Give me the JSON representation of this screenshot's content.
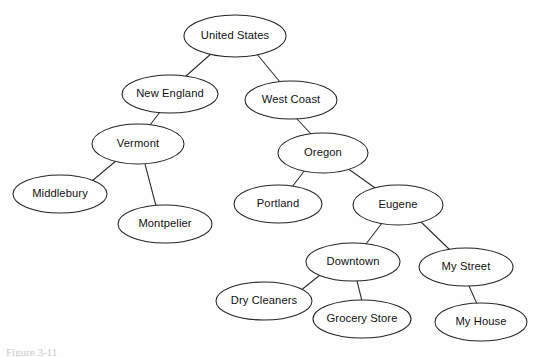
{
  "diagram": {
    "caption": "Figure 3-11",
    "stroke_color": "#232323",
    "node_fill": "#ffffff",
    "background": "#fefefe",
    "nodes": [
      {
        "id": "united-states",
        "label": "United States",
        "cx": 235,
        "cy": 36,
        "rx": 51,
        "ry": 21
      },
      {
        "id": "new-england",
        "label": "New England",
        "cx": 170,
        "cy": 94,
        "rx": 48,
        "ry": 19
      },
      {
        "id": "west-coast",
        "label": "West Coast",
        "cx": 291,
        "cy": 100,
        "rx": 46,
        "ry": 19
      },
      {
        "id": "vermont",
        "label": "Vermont",
        "cx": 138,
        "cy": 144,
        "rx": 46,
        "ry": 20
      },
      {
        "id": "oregon",
        "label": "Oregon",
        "cx": 323,
        "cy": 153,
        "rx": 45,
        "ry": 20
      },
      {
        "id": "middlebury",
        "label": "Middlebury",
        "cx": 60,
        "cy": 194,
        "rx": 47,
        "ry": 19
      },
      {
        "id": "montpelier",
        "label": "Montpelier",
        "cx": 165,
        "cy": 224,
        "rx": 47,
        "ry": 19
      },
      {
        "id": "portland",
        "label": "Portland",
        "cx": 278,
        "cy": 204,
        "rx": 44,
        "ry": 19
      },
      {
        "id": "eugene",
        "label": "Eugene",
        "cx": 398,
        "cy": 205,
        "rx": 45,
        "ry": 20
      },
      {
        "id": "downtown",
        "label": "Downtown",
        "cx": 353,
        "cy": 262,
        "rx": 47,
        "ry": 19
      },
      {
        "id": "my-street",
        "label": "My Street",
        "cx": 466,
        "cy": 267,
        "rx": 47,
        "ry": 19
      },
      {
        "id": "dry-cleaners",
        "label": "Dry Cleaners",
        "cx": 264,
        "cy": 301,
        "rx": 48,
        "ry": 19
      },
      {
        "id": "grocery-store",
        "label": "Grocery Store",
        "cx": 362,
        "cy": 319,
        "rx": 49,
        "ry": 19
      },
      {
        "id": "my-house",
        "label": "My House",
        "cx": 481,
        "cy": 322,
        "rx": 46,
        "ry": 19
      }
    ],
    "edges": [
      {
        "id": "edge-us-ne",
        "from": "united-states",
        "to": "new-england",
        "x1": 212,
        "y1": 53,
        "x2": 186,
        "y2": 76
      },
      {
        "id": "edge-us-wc",
        "from": "united-states",
        "to": "west-coast",
        "x1": 256,
        "y1": 53,
        "x2": 280,
        "y2": 82
      },
      {
        "id": "edge-ne-vt",
        "from": "new-england",
        "to": "vermont",
        "x1": 160,
        "y1": 112,
        "x2": 150,
        "y2": 125
      },
      {
        "id": "edge-wc-or",
        "from": "west-coast",
        "to": "oregon",
        "x1": 297,
        "y1": 119,
        "x2": 311,
        "y2": 134
      },
      {
        "id": "edge-vt-mid",
        "from": "vermont",
        "to": "middlebury",
        "x1": 117,
        "y1": 160,
        "x2": 92,
        "y2": 181
      },
      {
        "id": "edge-vt-mont",
        "from": "vermont",
        "to": "montpelier",
        "x1": 145,
        "y1": 164,
        "x2": 156,
        "y2": 206
      },
      {
        "id": "edge-or-port",
        "from": "oregon",
        "to": "portland",
        "x1": 305,
        "y1": 170,
        "x2": 292,
        "y2": 187
      },
      {
        "id": "edge-or-eug",
        "from": "oregon",
        "to": "eugene",
        "x1": 347,
        "y1": 168,
        "x2": 378,
        "y2": 190
      },
      {
        "id": "edge-eug-down",
        "from": "eugene",
        "to": "downtown",
        "x1": 382,
        "y1": 223,
        "x2": 366,
        "y2": 244
      },
      {
        "id": "edge-eug-street",
        "from": "eugene",
        "to": "my-street",
        "x1": 420,
        "y1": 221,
        "x2": 450,
        "y2": 250
      },
      {
        "id": "edge-down-dry",
        "from": "downtown",
        "to": "dry-cleaners",
        "x1": 320,
        "y1": 275,
        "x2": 300,
        "y2": 291
      },
      {
        "id": "edge-down-grocery",
        "from": "downtown",
        "to": "grocery-store",
        "x1": 357,
        "y1": 281,
        "x2": 362,
        "y2": 301
      },
      {
        "id": "edge-street-house",
        "from": "my-street",
        "to": "my-house",
        "x1": 469,
        "y1": 286,
        "x2": 477,
        "y2": 304
      }
    ]
  }
}
